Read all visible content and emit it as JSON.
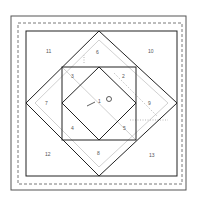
{
  "diagram": {
    "colors": {
      "line": "#222222",
      "dashed": "#555555",
      "guide": "#bbbbbb",
      "label": "#555555",
      "background": "#ffffff"
    },
    "labels": {
      "p1": "1",
      "p2": "2",
      "p3": "3",
      "p4": "4",
      "p5": "5",
      "p6": "6",
      "p7": "7",
      "p8": "8",
      "p9": "9",
      "p10": "10",
      "p11": "11",
      "p12": "12",
      "p13": "13"
    }
  }
}
